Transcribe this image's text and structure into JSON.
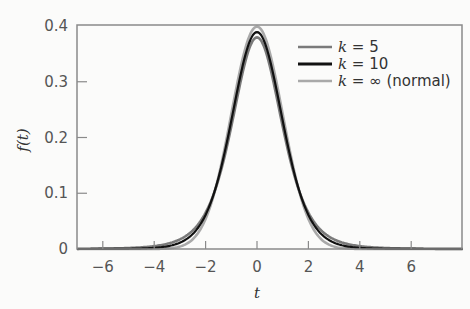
{
  "chart_data": {
    "type": "line",
    "title": "",
    "xlabel": "t",
    "ylabel": "f(t)",
    "xlim": [
      -7,
      8
    ],
    "ylim": [
      0,
      0.4
    ],
    "xticks": [
      -6,
      -4,
      -2,
      0,
      2,
      4,
      6
    ],
    "xtick_labels": [
      "−6",
      "−4",
      "−2",
      "0",
      "2",
      "4",
      "6"
    ],
    "yticks": [
      0,
      0.1,
      0.2,
      0.3,
      0.4
    ],
    "ytick_labels": [
      "0",
      "0.1",
      "0.2",
      "0.3",
      "0.4"
    ],
    "grid": false,
    "legend_position": "upper right",
    "series": [
      {
        "name": "k = 5",
        "k_label": "k",
        "rest_label": " = 5",
        "color": "#7a7a7a",
        "df": 5,
        "peak": 0.3796
      },
      {
        "name": "k = 10",
        "k_label": "k",
        "rest_label": " = 10",
        "color": "#111111",
        "df": 10,
        "peak": 0.3891
      },
      {
        "name": "k = ∞ (normal)",
        "k_label": "k",
        "rest_label": " = ∞ (normal)",
        "color": "#a9a9a9",
        "df": null,
        "peak": 0.3989
      }
    ]
  }
}
